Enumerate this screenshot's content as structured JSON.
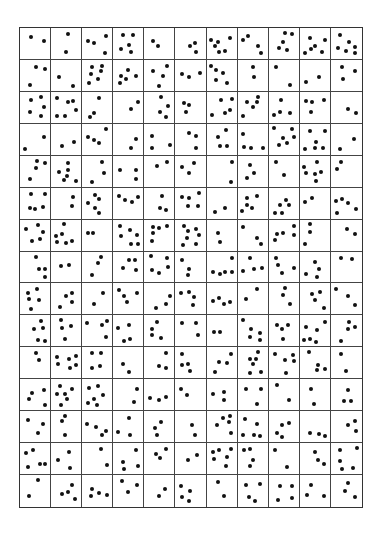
{
  "worksheet": {
    "columns": 11,
    "rows": 15,
    "dot_color": "#111111",
    "line_color": "#444444",
    "dot_counts": [
      [
        2,
        2,
        4,
        5,
        2,
        3,
        6,
        4,
        5,
        6,
        6
      ],
      [
        3,
        2,
        6,
        5,
        4,
        3,
        5,
        2,
        2,
        2,
        3
      ],
      [
        5,
        6,
        3,
        2,
        4,
        3,
        5,
        5,
        4,
        4,
        2
      ],
      [
        2,
        2,
        4,
        2,
        3,
        3,
        4,
        4,
        6,
        6,
        2
      ],
      [
        4,
        6,
        3,
        3,
        2,
        3,
        2,
        3,
        2,
        6,
        2
      ],
      [
        5,
        2,
        5,
        4,
        3,
        5,
        2,
        5,
        5,
        2,
        5
      ],
      [
        5,
        6,
        2,
        6,
        5,
        7,
        2,
        3,
        5,
        3,
        2
      ],
      [
        4,
        2,
        3,
        4,
        5,
        3,
        5,
        4,
        4,
        4,
        2
      ],
      [
        5,
        4,
        2,
        4,
        3,
        4,
        4,
        2,
        3,
        4,
        3
      ],
      [
        5,
        4,
        4,
        4,
        4,
        3,
        2,
        5,
        4,
        6,
        4
      ],
      [
        2,
        6,
        4,
        2,
        3,
        4,
        4,
        6,
        5,
        4,
        2
      ],
      [
        4,
        6,
        6,
        2,
        3,
        2,
        3,
        3,
        2,
        2,
        3
      ],
      [
        3,
        3,
        4,
        3,
        3,
        2,
        5,
        5,
        4,
        3,
        3
      ],
      [
        5,
        3,
        2,
        4,
        3,
        2,
        6,
        4,
        2,
        3,
        5
      ],
      [
        2,
        4,
        4,
        3,
        2,
        4,
        2,
        4,
        4,
        3,
        3
      ]
    ]
  }
}
